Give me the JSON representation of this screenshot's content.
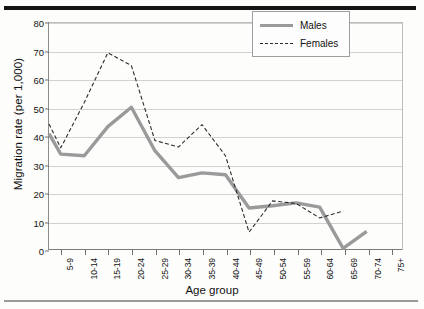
{
  "figure": {
    "rule_top": "thick-black-rule",
    "rule_bottom": "thin-gray-rule"
  },
  "legend": {
    "position": "top-right",
    "entries": [
      {
        "label": "Males",
        "style": "solid-thick-gray",
        "color": "#9a9a9a"
      },
      {
        "label": "Females",
        "style": "dashed-thin-black",
        "color": "#2b2b2b"
      }
    ]
  },
  "chart_data": {
    "type": "line",
    "title": "",
    "xlabel": "Age group",
    "ylabel": "Migration rate (per 1,000)",
    "ylim": [
      0,
      80
    ],
    "ytick_step": 10,
    "yticks": [
      0,
      10,
      20,
      30,
      40,
      50,
      60,
      70,
      80
    ],
    "grid": true,
    "legend_position": "top-right",
    "categories": [
      "5-9",
      "10-14",
      "15-19",
      "20-24",
      "25-29",
      "30-34",
      "35-39",
      "40-44",
      "45-49",
      "50-54",
      "55-59",
      "60-64",
      "65-69",
      "70-74",
      "75+"
    ],
    "series": [
      {
        "name": "Males",
        "color": "#9a9a9a",
        "style": "solid",
        "width": 3.4,
        "values": [
          33.8,
          33.2,
          43.5,
          50.3,
          35.0,
          25.5,
          27.2,
          26.5,
          14.8,
          15.6,
          16.6,
          15.1,
          0.6,
          6.6,
          null
        ],
        "start_value": 41.0
      },
      {
        "name": "Females",
        "color": "#2b2b2b",
        "style": "dashed",
        "width": 1.1,
        "values": [
          36.0,
          52.0,
          69.5,
          65.0,
          38.6,
          36.3,
          44.2,
          33.2,
          6.3,
          17.3,
          16.4,
          11.3,
          13.7,
          null,
          null
        ],
        "start_value": 44.4
      }
    ]
  }
}
